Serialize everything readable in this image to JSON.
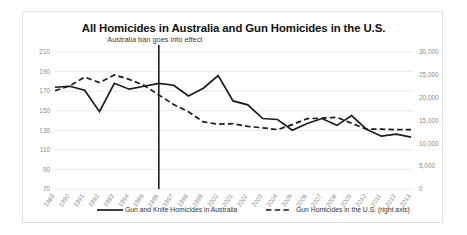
{
  "chart_data": {
    "type": "line",
    "title": "All Homicides in Australia and Gun Homicides in the U.S.",
    "xlabel": "",
    "ylabel": "",
    "grid": true,
    "legend_position": "bottom",
    "x": [
      1989,
      1990,
      1991,
      1992,
      1993,
      1994,
      1995,
      1996,
      1997,
      1998,
      1999,
      2000,
      2001,
      2002,
      2003,
      2004,
      2005,
      2006,
      2007,
      2008,
      2009,
      2010,
      2011,
      2012,
      2013
    ],
    "xtick_labels": [
      "1989",
      "1990",
      "1991",
      "1992",
      "1993",
      "1994",
      "1995",
      "1996",
      "1997",
      "1998",
      "1999",
      "2000",
      "2001",
      "2002",
      "2003",
      "2004",
      "2005",
      "2006",
      "2007",
      "2008",
      "2009",
      "2010",
      "2011",
      "2012",
      "2013"
    ],
    "left_axis": {
      "ticks": [
        70,
        90,
        110,
        130,
        150,
        170,
        190,
        210
      ],
      "tick_labels": [
        "70",
        "90",
        "110",
        "130",
        "150",
        "170",
        "190",
        "210"
      ],
      "ylim": [
        70,
        210
      ]
    },
    "right_axis": {
      "ticks": [
        0,
        5000,
        10000,
        15000,
        20000,
        25000,
        30000
      ],
      "tick_labels": [
        "0",
        "5,000",
        "10,000",
        "15,000",
        "20,000",
        "25,000",
        "30,000"
      ],
      "ylim": [
        0,
        30000
      ],
      "note": "right axis"
    },
    "series": [
      {
        "name": "Gun and Knife Homicides in Australia",
        "axis": "left",
        "style": "solid",
        "color": "#1a1a1a",
        "values": [
          174,
          175,
          171,
          149,
          178,
          172,
          175,
          178,
          176,
          165,
          173,
          186,
          160,
          156,
          142,
          141,
          130,
          137,
          142,
          135,
          145,
          131,
          124,
          126,
          123
        ]
      },
      {
        "name": "Gun Homicides in the U.S. (right axis)",
        "axis": "right",
        "style": "dashed",
        "color": "#1a1a1a",
        "values": [
          21500,
          22600,
          24500,
          23300,
          25000,
          24000,
          22700,
          20600,
          18500,
          16900,
          14700,
          14200,
          14300,
          13700,
          13400,
          13000,
          14100,
          15400,
          15500,
          15700,
          14400,
          13100,
          13100,
          13000,
          13000
        ]
      }
    ],
    "annotations": [
      {
        "text": "Australia ban goes into effect",
        "x": 1996,
        "type": "vertical-line-with-label"
      }
    ]
  },
  "legend": {
    "items": [
      {
        "label": "Gun and Knife Homicides in Australia",
        "style": "solid"
      },
      {
        "label": "Gun Homicides in the U.S. (right axis)",
        "style": "dashed"
      }
    ]
  }
}
